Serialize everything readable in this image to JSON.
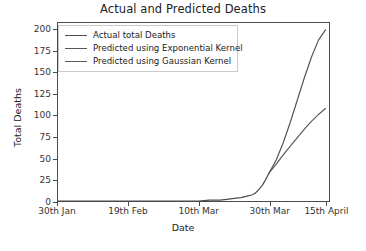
{
  "chart_data": {
    "type": "line",
    "title": "Actual and Predicted Deaths",
    "xlabel": "Date",
    "ylabel": "Total Deaths",
    "grid": false,
    "legend_position": "upper left",
    "ylim": [
      0,
      208
    ],
    "yticks": [
      0,
      25,
      50,
      75,
      100,
      125,
      150,
      175,
      200
    ],
    "ytick_labels": [
      "0",
      "25",
      "50",
      "75",
      "100",
      "125",
      "150",
      "175",
      "200"
    ],
    "xlim": [
      0,
      77
    ],
    "xticks": [
      0,
      20,
      40,
      60,
      76
    ],
    "xtick_labels": [
      "30th Jan",
      "19th Feb",
      "10th Mar",
      "30th Mar",
      "15th April"
    ],
    "series": [
      {
        "name": "Actual total Deaths",
        "color": "#4d4d4d",
        "x": [
          0,
          4,
          8,
          12,
          16,
          20,
          24,
          28,
          32,
          36,
          40,
          43,
          46,
          48,
          50,
          52,
          54,
          55,
          56,
          57,
          58,
          59,
          60
        ],
        "values": [
          0,
          0,
          0,
          0,
          0,
          0,
          0,
          0,
          0,
          0,
          0,
          1,
          1,
          2,
          3,
          4,
          6,
          7,
          9,
          13,
          18,
          25,
          33
        ]
      },
      {
        "name": "Predicted using Exponential Kernel",
        "color": "#555555",
        "x": [
          60,
          62,
          64,
          66,
          68,
          70,
          72,
          74,
          76
        ],
        "values": [
          33,
          48,
          68,
          92,
          118,
          144,
          168,
          188,
          200
        ]
      },
      {
        "name": "Predicted using Gaussian Kernel",
        "color": "#5a5a5a",
        "x": [
          60,
          62,
          64,
          66,
          68,
          70,
          72,
          74,
          76
        ],
        "values": [
          33,
          43,
          54,
          64,
          74,
          84,
          93,
          101,
          108
        ]
      }
    ],
    "annotations": {
      "divergence_point": {
        "x_label": "30th Mar",
        "value": 33
      }
    }
  },
  "legend": {
    "entries": [
      {
        "label": "Actual total Deaths"
      },
      {
        "label": "Predicted using Exponential Kernel"
      },
      {
        "label": "Predicted using Gaussian Kernel"
      }
    ]
  }
}
